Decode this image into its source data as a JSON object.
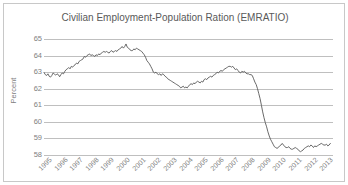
{
  "chart_data": {
    "type": "line",
    "title": "Civilian Employment-Population Ration (EMRATIO)",
    "xlabel": "",
    "ylabel": "Percent",
    "ylim": [
      58,
      65
    ],
    "ytick_labels": [
      "65",
      "64",
      "63",
      "62",
      "61",
      "60",
      "59",
      "58"
    ],
    "ytick_values": [
      65,
      64,
      63,
      62,
      61,
      60,
      59,
      58
    ],
    "xtick_labels": [
      "1995",
      "1996",
      "1997",
      "1998",
      "1999",
      "2000",
      "2001",
      "2002",
      "2003",
      "2004",
      "2005",
      "2006",
      "2007",
      "2008",
      "2009",
      "2010",
      "2011",
      "2012",
      "2013"
    ],
    "xlim": [
      1995.0,
      2013.5
    ],
    "grid": true,
    "legend": false,
    "line_color": "#595959",
    "grid_color": "#bfbfbf",
    "text_color": "#808080",
    "series": [
      {
        "name": "EMRATIO",
        "x": [
          1995.0,
          1995.083,
          1995.167,
          1995.25,
          1995.333,
          1995.417,
          1995.5,
          1995.583,
          1995.667,
          1995.75,
          1995.833,
          1995.917,
          1996.0,
          1996.083,
          1996.167,
          1996.25,
          1996.333,
          1996.417,
          1996.5,
          1996.583,
          1996.667,
          1996.75,
          1996.833,
          1996.917,
          1997.0,
          1997.083,
          1997.167,
          1997.25,
          1997.333,
          1997.417,
          1997.5,
          1997.583,
          1997.667,
          1997.75,
          1997.833,
          1997.917,
          1998.0,
          1998.083,
          1998.167,
          1998.25,
          1998.333,
          1998.417,
          1998.5,
          1998.583,
          1998.667,
          1998.75,
          1998.833,
          1998.917,
          1999.0,
          1999.083,
          1999.167,
          1999.25,
          1999.333,
          1999.417,
          1999.5,
          1999.583,
          1999.667,
          1999.75,
          1999.833,
          1999.917,
          2000.0,
          2000.083,
          2000.167,
          2000.25,
          2000.333,
          2000.417,
          2000.5,
          2000.583,
          2000.667,
          2000.75,
          2000.833,
          2000.917,
          2001.0,
          2001.083,
          2001.167,
          2001.25,
          2001.333,
          2001.417,
          2001.5,
          2001.583,
          2001.667,
          2001.75,
          2001.833,
          2001.917,
          2002.0,
          2002.083,
          2002.167,
          2002.25,
          2002.333,
          2002.417,
          2002.5,
          2002.583,
          2002.667,
          2002.75,
          2002.833,
          2002.917,
          2003.0,
          2003.083,
          2003.167,
          2003.25,
          2003.333,
          2003.417,
          2003.5,
          2003.583,
          2003.667,
          2003.75,
          2003.833,
          2003.917,
          2004.0,
          2004.083,
          2004.167,
          2004.25,
          2004.333,
          2004.417,
          2004.5,
          2004.583,
          2004.667,
          2004.75,
          2004.833,
          2004.917,
          2005.0,
          2005.083,
          2005.167,
          2005.25,
          2005.333,
          2005.417,
          2005.5,
          2005.583,
          2005.667,
          2005.75,
          2005.833,
          2005.917,
          2006.0,
          2006.083,
          2006.167,
          2006.25,
          2006.333,
          2006.417,
          2006.5,
          2006.583,
          2006.667,
          2006.75,
          2006.833,
          2006.917,
          2007.0,
          2007.083,
          2007.167,
          2007.25,
          2007.333,
          2007.417,
          2007.5,
          2007.583,
          2007.667,
          2007.75,
          2007.833,
          2007.917,
          2008.0,
          2008.083,
          2008.167,
          2008.25,
          2008.333,
          2008.417,
          2008.5,
          2008.583,
          2008.667,
          2008.75,
          2008.833,
          2008.917,
          2009.0,
          2009.083,
          2009.167,
          2009.25,
          2009.333,
          2009.417,
          2009.5,
          2009.583,
          2009.667,
          2009.75,
          2009.833,
          2009.917,
          2010.0,
          2010.083,
          2010.167,
          2010.25,
          2010.333,
          2010.417,
          2010.5,
          2010.583,
          2010.667,
          2010.75,
          2010.833,
          2010.917,
          2011.0,
          2011.083,
          2011.167,
          2011.25,
          2011.333,
          2011.417,
          2011.5,
          2011.583,
          2011.667,
          2011.75,
          2011.833,
          2011.917,
          2012.0,
          2012.083,
          2012.167,
          2012.25,
          2012.333,
          2012.417,
          2012.5,
          2012.583,
          2012.667,
          2012.75,
          2012.833,
          2012.917,
          2013.0,
          2013.083,
          2013.167,
          2013.25,
          2013.333
        ],
        "values": [
          62.98,
          62.85,
          62.8,
          62.9,
          62.75,
          62.7,
          62.8,
          62.95,
          62.88,
          62.82,
          62.9,
          62.85,
          62.72,
          62.85,
          62.95,
          62.9,
          63.05,
          63.15,
          63.2,
          63.28,
          63.2,
          63.35,
          63.3,
          63.4,
          63.45,
          63.55,
          63.5,
          63.65,
          63.7,
          63.75,
          63.8,
          63.95,
          63.9,
          64.0,
          64.05,
          64.1,
          64.0,
          64.05,
          64.0,
          63.95,
          64.05,
          64.0,
          64.1,
          64.05,
          64.15,
          64.2,
          64.25,
          64.2,
          64.25,
          64.2,
          64.15,
          64.25,
          64.3,
          64.2,
          64.25,
          64.3,
          64.25,
          64.35,
          64.4,
          64.45,
          64.55,
          64.45,
          64.55,
          64.7,
          64.5,
          64.45,
          64.35,
          64.3,
          64.3,
          64.4,
          64.35,
          64.45,
          64.4,
          64.35,
          64.3,
          64.25,
          64.15,
          64.05,
          63.9,
          63.7,
          63.6,
          63.5,
          63.35,
          63.2,
          63.0,
          62.95,
          63.0,
          62.9,
          62.85,
          62.9,
          62.8,
          62.9,
          62.85,
          62.75,
          62.7,
          62.6,
          62.55,
          62.5,
          62.45,
          62.4,
          62.35,
          62.3,
          62.25,
          62.2,
          62.15,
          62.05,
          62.1,
          62.15,
          62.05,
          62.1,
          62.05,
          62.15,
          62.25,
          62.3,
          62.25,
          62.35,
          62.3,
          62.4,
          62.45,
          62.4,
          62.35,
          62.45,
          62.4,
          62.55,
          62.6,
          62.55,
          62.65,
          62.7,
          62.75,
          62.7,
          62.8,
          62.85,
          62.9,
          63.0,
          62.95,
          63.05,
          63.1,
          63.05,
          63.15,
          63.2,
          63.25,
          63.3,
          63.35,
          63.35,
          63.3,
          63.35,
          63.25,
          63.15,
          63.2,
          63.1,
          63.0,
          62.95,
          63.05,
          63.0,
          63.05,
          62.95,
          62.9,
          62.9,
          62.85,
          62.85,
          62.8,
          62.6,
          62.4,
          62.25,
          62.0,
          61.7,
          61.4,
          61.0,
          60.6,
          60.25,
          59.95,
          59.7,
          59.4,
          59.15,
          58.95,
          58.8,
          58.65,
          58.5,
          58.45,
          58.4,
          58.45,
          58.55,
          58.6,
          58.7,
          58.6,
          58.5,
          58.45,
          58.45,
          58.5,
          58.4,
          58.35,
          58.35,
          58.4,
          58.45,
          58.4,
          58.35,
          58.25,
          58.2,
          58.25,
          58.3,
          58.4,
          58.45,
          58.5,
          58.55,
          58.5,
          58.6,
          58.55,
          58.45,
          58.55,
          58.5,
          58.55,
          58.6,
          58.65,
          58.7,
          58.65,
          58.6,
          58.6,
          58.65,
          58.55,
          58.6,
          58.7
        ]
      }
    ]
  }
}
